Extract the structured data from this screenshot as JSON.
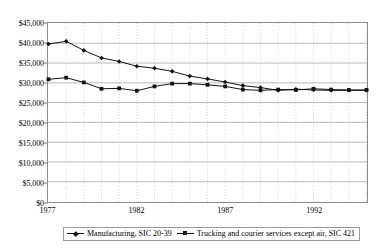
{
  "chart_data": {
    "type": "line",
    "title": "",
    "xlabel": "",
    "ylabel": "",
    "xlim": [
      1977,
      1995
    ],
    "ylim": [
      0,
      45000
    ],
    "ytick_step": 5000,
    "grid": true,
    "legend_position": "bottom",
    "x": [
      1977,
      1978,
      1979,
      1980,
      1981,
      1982,
      1983,
      1984,
      1985,
      1986,
      1987,
      1988,
      1989,
      1990,
      1991,
      1992,
      1993,
      1994,
      1995
    ],
    "xtick_labels": [
      "1977",
      "1982",
      "1987",
      "1992"
    ],
    "xtick_values": [
      1977,
      1982,
      1987,
      1992
    ],
    "ytick_labels": [
      "$45,000",
      "$40,000",
      "$35,000",
      "$30,000",
      "$25,000",
      "$20,000",
      "$15,000",
      "$10,000",
      "$5,000",
      "$0"
    ],
    "ytick_values": [
      45000,
      40000,
      35000,
      30000,
      25000,
      20000,
      15000,
      10000,
      5000,
      0
    ],
    "series": [
      {
        "name": "Manufacturing, SIC 20-39",
        "marker": "diamond",
        "color": "#111111",
        "values": [
          39800,
          40500,
          38200,
          36300,
          35400,
          34200,
          33700,
          32900,
          31700,
          31000,
          30200,
          29300,
          28800,
          28100,
          28400,
          28200,
          28100,
          28100,
          28100
        ]
      },
      {
        "name": "Trucking and courier services except air, SIC 421",
        "marker": "square",
        "color": "#111111",
        "values": [
          30900,
          31300,
          30100,
          28500,
          28600,
          28000,
          29100,
          29800,
          29800,
          29500,
          29100,
          28300,
          28100,
          28300,
          28200,
          28500,
          28300,
          28200,
          28200
        ]
      }
    ]
  },
  "legend": {
    "entries": [
      {
        "label": "Manufacturing, SIC 20-39"
      },
      {
        "label": "Trucking and courier services except air, SIC 421"
      }
    ]
  }
}
